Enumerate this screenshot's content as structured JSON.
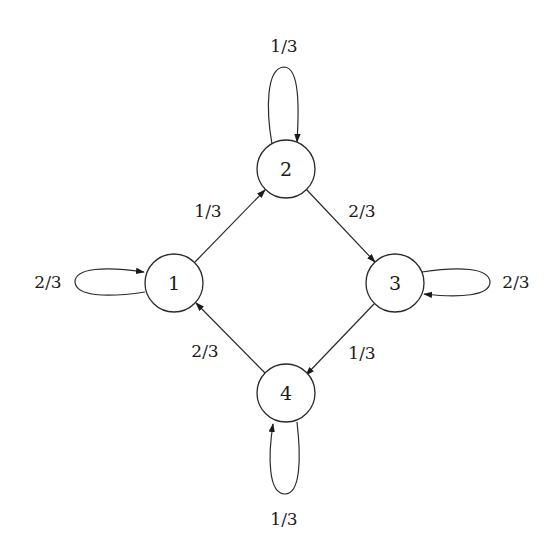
{
  "diagram": {
    "type": "markov-chain-state-diagram",
    "nodes": [
      {
        "id": "1",
        "label": "1"
      },
      {
        "id": "2",
        "label": "2"
      },
      {
        "id": "3",
        "label": "3"
      },
      {
        "id": "4",
        "label": "4"
      }
    ],
    "edges": [
      {
        "from": "1",
        "to": "1",
        "label": "2/3"
      },
      {
        "from": "1",
        "to": "2",
        "label": "1/3"
      },
      {
        "from": "2",
        "to": "2",
        "label": "1/3"
      },
      {
        "from": "2",
        "to": "3",
        "label": "2/3"
      },
      {
        "from": "3",
        "to": "3",
        "label": "2/3"
      },
      {
        "from": "3",
        "to": "4",
        "label": "1/3"
      },
      {
        "from": "4",
        "to": "4",
        "label": "1/3"
      },
      {
        "from": "4",
        "to": "1",
        "label": "2/3"
      }
    ]
  },
  "colors": {
    "stroke": "#2a2a2a",
    "background": "#ffffff"
  }
}
